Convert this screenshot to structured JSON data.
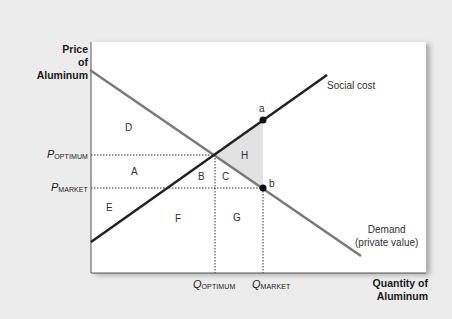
{
  "diagram": {
    "type": "externality-supply-demand",
    "y_axis_title": [
      "Price",
      "of",
      "Aluminum"
    ],
    "x_axis_title": [
      "Quantity of",
      "Aluminum"
    ],
    "price_levels": [
      {
        "id": "p_optimum",
        "symbol": "P",
        "subscript": "OPTIMUM"
      },
      {
        "id": "p_market",
        "symbol": "P",
        "subscript": "MARKET"
      }
    ],
    "quantity_levels": [
      {
        "id": "q_optimum",
        "symbol": "Q",
        "subscript": "OPTIMUM"
      },
      {
        "id": "q_market",
        "symbol": "Q",
        "subscript": "MARKET"
      }
    ],
    "curves": {
      "social_cost": {
        "label": "Social cost",
        "color": "#222222"
      },
      "demand": {
        "label_line1": "Demand",
        "label_line2": "(private value)",
        "color": "#7a7a7a"
      }
    },
    "points": [
      {
        "id": "a",
        "label": "a"
      },
      {
        "id": "b",
        "label": "b"
      }
    ],
    "regions": [
      "A",
      "B",
      "C",
      "D",
      "E",
      "F",
      "G",
      "H"
    ],
    "shaded_region": {
      "label": "H",
      "color": "#e2e2e2"
    }
  }
}
